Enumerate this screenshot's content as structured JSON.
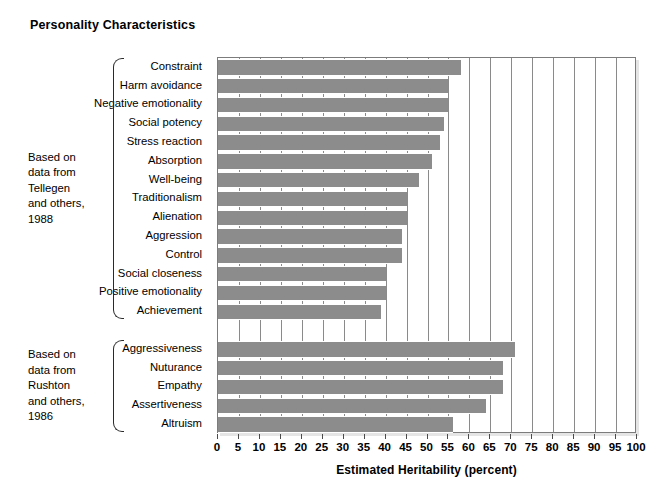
{
  "chart_data": {
    "type": "bar",
    "orientation": "horizontal",
    "title": "Personality Characteristics",
    "xlabel": "Estimated Heritability (percent)",
    "ylabel": "",
    "xlim": [
      0,
      100
    ],
    "xticks": [
      0,
      5,
      10,
      15,
      20,
      25,
      30,
      35,
      40,
      45,
      50,
      55,
      60,
      65,
      70,
      75,
      80,
      85,
      90,
      95,
      100
    ],
    "grid": true,
    "legend": "none",
    "bar_color": "#8c8c8c",
    "categories": [
      "Constraint",
      "Harm avoidance",
      "Negative emotionality",
      "Social potency",
      "Stress reaction",
      "Absorption",
      "Well-being",
      "Traditionalism",
      "Alienation",
      "Aggression",
      "Control",
      "Social closeness",
      "Positive emotionality",
      "Achievement",
      "Aggressiveness",
      "Nuturance",
      "Empathy",
      "Assertiveness",
      "Altruism"
    ],
    "values": [
      58,
      55,
      55,
      54,
      53,
      51,
      48,
      45,
      45,
      44,
      44,
      40,
      40,
      39,
      71,
      68,
      68,
      64,
      56
    ],
    "groups": [
      {
        "note": "Based on\ndata from\nTellegen\nand others,\n1988",
        "categories": [
          "Constraint",
          "Harm avoidance",
          "Negative emotionality",
          "Social potency",
          "Stress reaction",
          "Absorption",
          "Well-being",
          "Traditionalism",
          "Alienation",
          "Aggression",
          "Control",
          "Social closeness",
          "Positive emotionality",
          "Achievement"
        ],
        "values": [
          58,
          55,
          55,
          54,
          53,
          51,
          48,
          45,
          45,
          44,
          44,
          40,
          40,
          39
        ]
      },
      {
        "note": "Based on\ndata from\nRushton\nand others,\n1986",
        "categories": [
          "Aggressiveness",
          "Nuturance",
          "Empathy",
          "Assertiveness",
          "Altruism"
        ],
        "values": [
          71,
          68,
          68,
          64,
          56
        ]
      }
    ]
  },
  "colors": {
    "bar": "#8c8c8c",
    "grid": "#8a8a8a",
    "frame": "#7c7c7c",
    "text": "#000000"
  }
}
